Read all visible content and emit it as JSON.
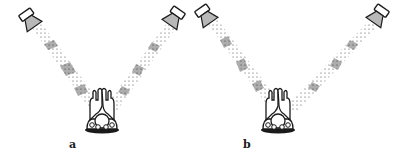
{
  "figure": {
    "panels": [
      {
        "id": "a",
        "label": "a",
        "speakers": [
          {
            "side": "left",
            "x": 28,
            "y": 20,
            "angle": -35
          },
          {
            "side": "right",
            "x": 178,
            "y": 20,
            "angle": 35
          }
        ],
        "target": {
          "x": 100,
          "y": 118
        },
        "beam_bands": "dense wavefront bands evenly spaced along both beams"
      },
      {
        "id": "b",
        "label": "b",
        "speakers": [
          {
            "side": "left",
            "x": 205,
            "y": 16,
            "angle": -35
          },
          {
            "side": "right",
            "x": 380,
            "y": 16,
            "angle": 35
          }
        ],
        "target": {
          "x": 275,
          "y": 118
        },
        "beam_bands": "dense wavefront bands offset between left and right beams"
      }
    ],
    "colors": {
      "ink": "#1a1a1a",
      "speaker_fill": "#b8b8b8",
      "background": "#ffffff"
    }
  }
}
